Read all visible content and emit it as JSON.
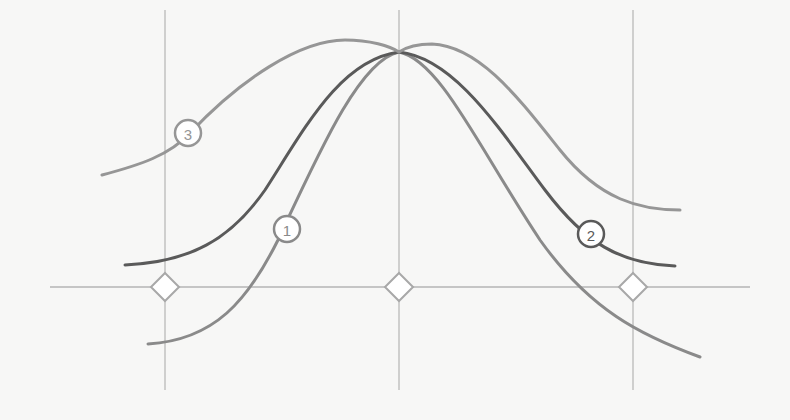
{
  "diagram": {
    "type": "bell-curve-comparison",
    "colors": {
      "background": "#f7f7f6",
      "grid": "#b4b4b4",
      "marker_stroke": "#a8a8a8",
      "marker_fill": "#ffffff",
      "curve_1": "#8a8a8a",
      "curve_2": "#5a5a5a",
      "curve_3": "#969696"
    },
    "grid": {
      "vertical_lines_x": [
        165,
        399,
        633
      ],
      "vertical_top": 10,
      "vertical_bottom": 390,
      "axis_y": 287,
      "axis_x_start": 50,
      "axis_x_end": 750
    },
    "markers": [
      {
        "name": "left-marker",
        "x": 165,
        "y": 287
      },
      {
        "name": "center-marker",
        "x": 399,
        "y": 287
      },
      {
        "name": "right-marker",
        "x": 633,
        "y": 287
      }
    ],
    "curves": [
      {
        "id": "1",
        "label": "1",
        "description": "steepest / narrowest curve",
        "path": "M148,344 C215,340 248,300 278,240 C320,150 360,60 399,52 C440,60 480,150 540,240 C590,310 640,335 700,357",
        "label_pos": {
          "x": 287,
          "y": 229
        }
      },
      {
        "id": "2",
        "label": "2",
        "description": "medium-width curve",
        "path": "M125,265 C190,262 230,240 265,190 C305,128 340,60 399,52 C455,58 500,130 545,190 C585,243 620,264 675,266",
        "label_pos": {
          "x": 591,
          "y": 234
        }
      },
      {
        "id": "3",
        "label": "3",
        "description": "widest / flattest curve",
        "path": "M102,175 C140,165 170,155 190,133 C240,80 300,40 345,40 C370,40 390,46 399,52 C408,46 420,44 432,44 C480,46 520,100 560,150 C600,200 640,210 680,210",
        "label_pos": {
          "x": 188,
          "y": 133
        }
      }
    ],
    "peak_point": {
      "x": 399,
      "y": 52
    }
  }
}
